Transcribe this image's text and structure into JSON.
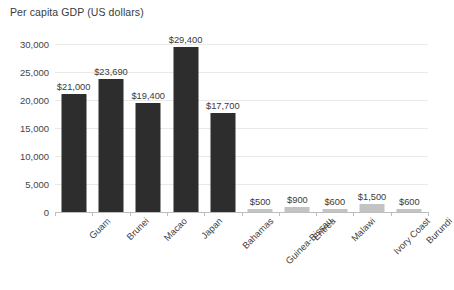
{
  "chart_data": {
    "type": "bar",
    "title": "Per capita GDP (US dollars)",
    "xlabel": "",
    "ylabel": "",
    "ylim": [
      0,
      30000
    ],
    "yticks": [
      0,
      5000,
      10000,
      15000,
      20000,
      25000,
      30000
    ],
    "ytick_labels": [
      "0",
      "5,000",
      "10,000",
      "15,000",
      "20,000",
      "25,000",
      "30,000"
    ],
    "grid": true,
    "legend": "none",
    "categories": [
      "Guam",
      "Brunei",
      "Macao",
      "Japan",
      "Bahamas",
      "Guinea-Bissau",
      "Eritrea",
      "Malawi",
      "Ivory Coast",
      "Burundi"
    ],
    "values": [
      21000,
      23690,
      19400,
      29400,
      17700,
      500,
      900,
      600,
      1500,
      600
    ],
    "value_labels": [
      "$21,000",
      "$23,690",
      "$19,400",
      "$29,400",
      "$17,700",
      "$500",
      "$900",
      "$600",
      "$1,500",
      "$600"
    ],
    "bar_colors": [
      "#2d2d2d",
      "#2d2d2d",
      "#2d2d2d",
      "#2d2d2d",
      "#2d2d2d",
      "#c3c3c3",
      "#c3c3c3",
      "#c3c3c3",
      "#c3c3c3",
      "#c3c3c3"
    ],
    "colors": {
      "high_income_bar": "#2d2d2d",
      "low_income_bar": "#c3c3c3",
      "gridline": "#e9e9e9",
      "axis": "#bdbdbd",
      "text": "#3a3a3a",
      "background": "#ffffff"
    }
  }
}
